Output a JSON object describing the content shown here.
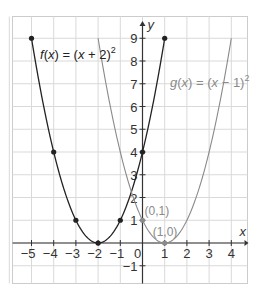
{
  "chart_data": {
    "type": "line",
    "title": "",
    "xlabel": "x",
    "ylabel": "y",
    "xlim": [
      -6,
      4.7
    ],
    "ylim": [
      -1.8,
      9.7
    ],
    "grid": true,
    "x_ticks": [
      -5,
      -4,
      -3,
      -2,
      -1,
      0,
      1,
      2,
      3,
      4
    ],
    "x_tick_labels": [
      "−5",
      "−4",
      "−3",
      "−2",
      "−1",
      "0",
      "1",
      "2",
      "3",
      "4"
    ],
    "y_ticks": [
      -1,
      1,
      2,
      3,
      4,
      5,
      6,
      7,
      8,
      9
    ],
    "y_tick_labels": [
      "−1",
      "1",
      "2",
      "3",
      "4",
      "5",
      "6",
      "7",
      "8",
      "9"
    ],
    "series": [
      {
        "name": "f(x) = (x + 2)²",
        "label_main": "f(x) = (x + 2)",
        "label_sup": "2",
        "color": "#222222",
        "expr": "(x+2)^2",
        "x_range": [
          -5,
          1
        ],
        "points": [
          [
            -5,
            9
          ],
          [
            -4,
            4
          ],
          [
            -3,
            1
          ],
          [
            -2,
            0
          ],
          [
            -1,
            1
          ],
          [
            0,
            4
          ],
          [
            1,
            9
          ]
        ]
      },
      {
        "name": "g(x) = (x − 1)²",
        "label_main": "g(x) = (x − 1)",
        "label_sup": "2",
        "color": "#8a8a8a",
        "expr": "(x-1)^2",
        "x_range": [
          -2,
          4
        ],
        "points": [
          [
            0,
            1
          ],
          [
            1,
            0
          ]
        ]
      }
    ],
    "annotations": [
      {
        "text": "(0,1)",
        "x": 0,
        "y": 1
      },
      {
        "text": "(1,0)",
        "x": 1,
        "y": 0
      }
    ]
  },
  "colors": {
    "grid": "#d9d9d9",
    "border": "#cccccc",
    "axis": "#333333",
    "f": "#222222",
    "g": "#8a8a8a"
  }
}
